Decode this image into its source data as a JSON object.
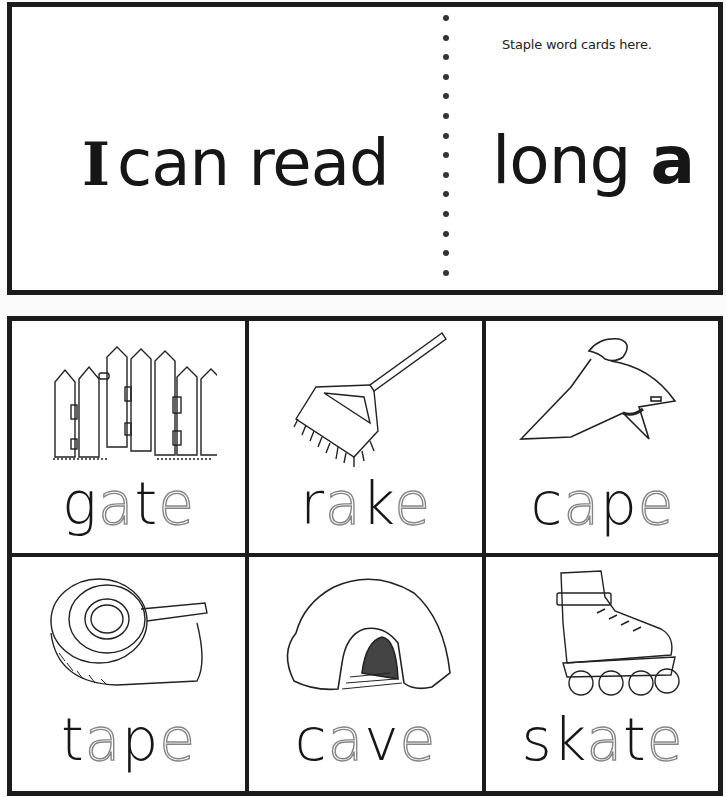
{
  "header": {
    "staple_note": "Staple word cards here.",
    "title_left_i": "I",
    "title_left_rest": "can read",
    "title_right_word": "long",
    "title_right_letter": "a"
  },
  "cards": [
    {
      "picture": "fence-gate",
      "word": "gate",
      "parts": [
        {
          "t": "g",
          "style": "solid"
        },
        {
          "t": "a",
          "style": "dotted"
        },
        {
          "t": "t",
          "style": "solid"
        },
        {
          "t": "e",
          "style": "dotted"
        }
      ]
    },
    {
      "picture": "rake",
      "word": "rake",
      "parts": [
        {
          "t": "r",
          "style": "solid"
        },
        {
          "t": "a",
          "style": "dotted"
        },
        {
          "t": "k",
          "style": "solid"
        },
        {
          "t": "e",
          "style": "dotted"
        }
      ]
    },
    {
      "picture": "cape",
      "word": "cape",
      "parts": [
        {
          "t": "c",
          "style": "solid"
        },
        {
          "t": "a",
          "style": "dotted"
        },
        {
          "t": "p",
          "style": "solid"
        },
        {
          "t": "e",
          "style": "dotted"
        }
      ]
    },
    {
      "picture": "tape-dispenser",
      "word": "tape",
      "parts": [
        {
          "t": "t",
          "style": "solid"
        },
        {
          "t": "a",
          "style": "dotted"
        },
        {
          "t": "p",
          "style": "solid"
        },
        {
          "t": "e",
          "style": "dotted"
        }
      ]
    },
    {
      "picture": "cave",
      "word": "cave",
      "parts": [
        {
          "t": "c",
          "style": "solid"
        },
        {
          "t": "a",
          "style": "dotted"
        },
        {
          "t": "v",
          "style": "solid"
        },
        {
          "t": "e",
          "style": "dotted"
        }
      ]
    },
    {
      "picture": "inline-skate",
      "word": "skate",
      "parts": [
        {
          "t": "s",
          "style": "solid"
        },
        {
          "t": "k",
          "style": "solid"
        },
        {
          "t": "a",
          "style": "dotted"
        },
        {
          "t": "t",
          "style": "solid"
        },
        {
          "t": "e",
          "style": "dotted"
        }
      ]
    }
  ],
  "colors": {
    "ink": "#161616",
    "border": "#1c1c1c",
    "paper": "#ffffff"
  }
}
